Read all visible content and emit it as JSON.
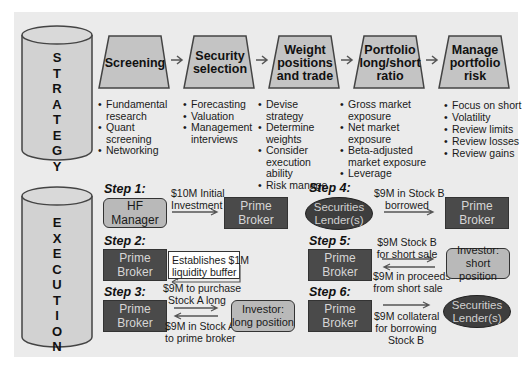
{
  "strategy": {
    "cylinder_label": [
      "S",
      "T",
      "R",
      "A",
      "T",
      "E",
      "G",
      "Y"
    ],
    "stages": [
      {
        "title": "Screening",
        "bullets": [
          "Fundamental research",
          "Quant screening",
          "Networking"
        ]
      },
      {
        "title": "Security selection",
        "bullets": [
          "Forecasting",
          "Valuation",
          "Management interviews"
        ]
      },
      {
        "title": "Weight positions and trade",
        "bullets": [
          "Devise strategy",
          "Determine weights",
          "Consider execution ability",
          "Risk manage"
        ]
      },
      {
        "title": "Portfolio long/short ratio",
        "bullets": [
          "Gross market exposure",
          "Net market exposure",
          "Beta-adjusted market exposure",
          "Leverage"
        ]
      },
      {
        "title": "Manage portfolio risk",
        "bullets": [
          "Focus on short",
          "Volatility",
          "Review limits",
          "Review losses",
          "Review gains"
        ]
      }
    ]
  },
  "execution": {
    "cylinder_label": [
      "E",
      "X",
      "E",
      "C",
      "U",
      "T",
      "I",
      "O",
      "N"
    ],
    "steps": [
      {
        "label": "Step 1:",
        "from": "HF Manager",
        "to": "Prime Broker",
        "flow": "$10M Initial Investment"
      },
      {
        "label": "Step 2:",
        "node": "Prime Broker",
        "flow": "Establishes $1M liquidity buffer"
      },
      {
        "label": "Step 3:",
        "from": "Prime Broker",
        "to": "Investor: long position",
        "flow_out": "$9M to purchase Stock A long",
        "flow_in": "$9M in Stock A to prime broker"
      },
      {
        "label": "Step 4:",
        "from": "Securities Lender(s)",
        "to": "Prime Broker",
        "flow": "$9M  in Stock B borrowed"
      },
      {
        "label": "Step 5:",
        "from": "Prime Broker",
        "to": "Investor: short position",
        "flow_out": "$9M Stock B for short sale",
        "flow_in": "$9M in proceeds from short sale"
      },
      {
        "label": "Step 6:",
        "from": "Prime Broker",
        "to": "Securities Lender(s)",
        "flow": "$9M collateral for borrowing Stock B"
      }
    ]
  },
  "text": {
    "s1_from_1": "HF",
    "s1_from_2": "Manager",
    "pb1": "Prime",
    "pb2": "Broker",
    "s1_flow_1": "$10M Initial",
    "s1_flow_2": "Investment",
    "s2_flow_1": "Establishes $1M",
    "s2_flow_2": "liquidity buffer",
    "s3_out_1": "$9M to purchase",
    "s3_out_2": "Stock A long",
    "s3_in_1": "$9M in Stock A",
    "s3_in_2": "to prime broker",
    "inv_long_1": "Investor:",
    "inv_long_2": "long position",
    "sl_1": "Securities",
    "sl_2": "Lender(s)",
    "s4_flow_1": "$9M  in Stock B",
    "s4_flow_2": "borrowed",
    "s5_out_1": "$9M Stock B",
    "s5_out_2": "for short sale",
    "s5_in_1": "$9M in proceeds",
    "s5_in_2": "from short sale",
    "inv_short_1": "Investor:",
    "inv_short_2": "short position",
    "s6_flow_1": "$9M collateral",
    "s6_flow_2": "for borrowing",
    "s6_flow_3": "Stock B"
  },
  "colors": {
    "panel": "#ebebeb",
    "dark_box": "#4a4a4a",
    "light_box": "#b9b9b9",
    "trapezoid": "#c4c4c4",
    "cylinder": "#d2d2d2"
  }
}
